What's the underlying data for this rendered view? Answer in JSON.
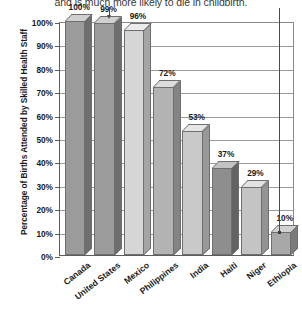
{
  "caption": {
    "text": "and is much more likely to die in childbirth."
  },
  "axes": {
    "ylabel": "Percentage of Births Attended by Skilled Health Staff",
    "yticks": [
      "100%",
      "90%",
      "80%",
      "70%",
      "60%",
      "50%",
      "40%",
      "30%",
      "20%",
      "10%",
      "0%"
    ]
  },
  "chart_data": {
    "type": "bar",
    "title": "",
    "subtitle": "",
    "xlabel": "",
    "ylabel": "Percentage of Births Attended by Skilled Health Staff",
    "categories": [
      "Canada",
      "United States",
      "Mexico",
      "Philippines",
      "India",
      "Haiti",
      "Niger",
      "Ethiopia"
    ],
    "values": [
      100,
      99,
      96,
      72,
      53,
      37,
      29,
      10
    ],
    "value_labels": [
      "100%",
      "99%",
      "96%",
      "72%",
      "53%",
      "37%",
      "29%",
      "10%"
    ],
    "ylim": [
      0,
      100
    ],
    "ytick_values": [
      0,
      10,
      20,
      30,
      40,
      50,
      60,
      70,
      80,
      90,
      100
    ],
    "grid": true,
    "legend": "none",
    "bar_colors": [
      "#9b9b9b",
      "#9b9b9b",
      "#d6d6d6",
      "#b3b3b3",
      "#c9c9c9",
      "#8e8e8e",
      "#c4c4c4",
      "#a8a8a8"
    ],
    "bar_top_colors": [
      "#d0d0d0",
      "#d0d0d0",
      "#ececec",
      "#dcdcdc",
      "#e6e6e6",
      "#c2c2c2",
      "#e2e2e2",
      "#d2d2d2"
    ],
    "bar_side_colors": [
      "#6e6e6e",
      "#6e6e6e",
      "#a5a5a5",
      "#848484",
      "#989898",
      "#636363",
      "#939393",
      "#7b7b7b"
    ],
    "annotations": [
      {
        "name": "arrow-to-united-states",
        "target": "United States"
      },
      {
        "name": "leader-to-ethiopia",
        "target": "Ethiopia"
      }
    ]
  },
  "colors": {
    "axis": "#5d5d5d",
    "grid": "#9a9a9a",
    "text": "#1b1b1b",
    "caption": "#3a3a3a"
  }
}
